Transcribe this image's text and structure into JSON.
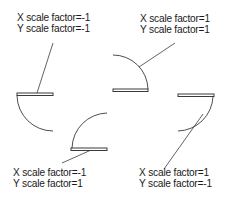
{
  "figure": {
    "stroke_color": "#3a3a3a",
    "text_color": "#1a1a1a",
    "background": "#ffffff"
  },
  "blocks": [
    {
      "id": "top-left",
      "x_label": "X scale factor=-1",
      "y_label": "Y scale factor=-1"
    },
    {
      "id": "top-right",
      "x_label": "X scale factor=1",
      "y_label": "Y scale factor=1"
    },
    {
      "id": "bottom-left",
      "x_label": "X scale factor=-1",
      "y_label": "Y scale factor=1"
    },
    {
      "id": "bottom-right",
      "x_label": "X scale factor=1",
      "y_label": "Y scale factor=-1"
    }
  ]
}
